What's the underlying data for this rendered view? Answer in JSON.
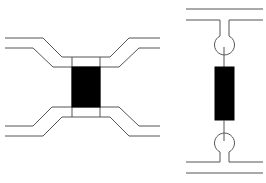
{
  "diagram": {
    "colors": {
      "line": "#555555",
      "fill": "#000000",
      "background": "#ffffff"
    },
    "left_figure": {
      "type": "funnel-connector",
      "element": {
        "x": 72,
        "y": 67,
        "w": 28,
        "h": 40
      },
      "bands": [
        {
          "y": 57,
          "h": 10
        },
        {
          "y": 107,
          "h": 10
        }
      ]
    },
    "right_figure": {
      "type": "bulb-connector",
      "element": {
        "x": 215,
        "y": 67,
        "w": 19,
        "h": 53
      },
      "circles": [
        {
          "cx": 224,
          "cy": 45,
          "r": 10
        },
        {
          "cx": 224,
          "cy": 143,
          "r": 10
        }
      ]
    }
  }
}
